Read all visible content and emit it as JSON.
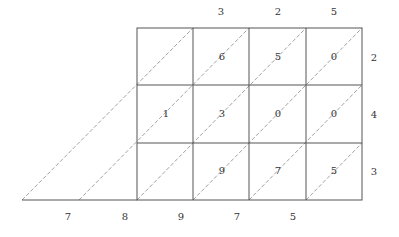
{
  "diagram": {
    "type": "lattice-multiplication",
    "top_digits": [
      "3",
      "2",
      "5"
    ],
    "right_digits": [
      "2",
      "4",
      "3"
    ],
    "bottom_digits": [
      "7",
      "8",
      "9",
      "7",
      "5"
    ],
    "cells": [
      [
        "",
        "6",
        "5",
        "0"
      ],
      [
        "1",
        "3",
        "0",
        "0"
      ],
      [
        "",
        "9",
        "7",
        "5"
      ]
    ],
    "colors": {
      "grid": "#555555",
      "diagonal": "#888888",
      "text": "#333333"
    }
  }
}
